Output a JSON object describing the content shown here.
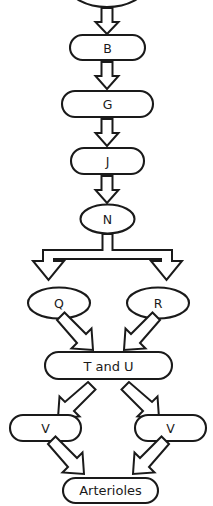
{
  "diagram": {
    "type": "flowchart",
    "orientation": "vertical-top-to-bottom",
    "background_color": "#ffffff",
    "stroke_color": "#1a1a1a",
    "fill_color": "#ffffff",
    "nodes": [
      {
        "id": "top",
        "label": "",
        "shape": "ellipse",
        "note": "cropped at top edge, label not visible"
      },
      {
        "id": "b",
        "label": "B",
        "shape": "stadium"
      },
      {
        "id": "g",
        "label": "G",
        "shape": "stadium"
      },
      {
        "id": "j",
        "label": "J",
        "shape": "stadium"
      },
      {
        "id": "n",
        "label": "N",
        "shape": "ellipse"
      },
      {
        "id": "q",
        "label": "Q",
        "shape": "ellipse"
      },
      {
        "id": "r",
        "label": "R",
        "shape": "ellipse"
      },
      {
        "id": "tu",
        "label": "T and U",
        "shape": "stadium"
      },
      {
        "id": "v_left",
        "label": "V",
        "shape": "stadium"
      },
      {
        "id": "v_right",
        "label": "V",
        "shape": "stadium"
      },
      {
        "id": "arterioles",
        "label": "Arterioles",
        "shape": "stadium"
      }
    ],
    "edges": [
      {
        "from": "top",
        "to": "b",
        "style": "block-arrow-down"
      },
      {
        "from": "b",
        "to": "g",
        "style": "block-arrow-down"
      },
      {
        "from": "g",
        "to": "j",
        "style": "block-arrow-down"
      },
      {
        "from": "j",
        "to": "n",
        "style": "block-arrow-down"
      },
      {
        "from": "n",
        "to": "q",
        "style": "block-arrow-split-down"
      },
      {
        "from": "n",
        "to": "r",
        "style": "block-arrow-split-down"
      },
      {
        "from": "q",
        "to": "tu",
        "style": "block-arrow-diagonal-down-right"
      },
      {
        "from": "r",
        "to": "tu",
        "style": "block-arrow-diagonal-down-left"
      },
      {
        "from": "tu",
        "to": "v_left",
        "style": "block-arrow-diagonal-down-left"
      },
      {
        "from": "tu",
        "to": "v_right",
        "style": "block-arrow-diagonal-down-right"
      },
      {
        "from": "v_left",
        "to": "arterioles",
        "style": "block-arrow-diagonal-down-right"
      },
      {
        "from": "v_right",
        "to": "arterioles",
        "style": "block-arrow-diagonal-down-left"
      }
    ]
  }
}
